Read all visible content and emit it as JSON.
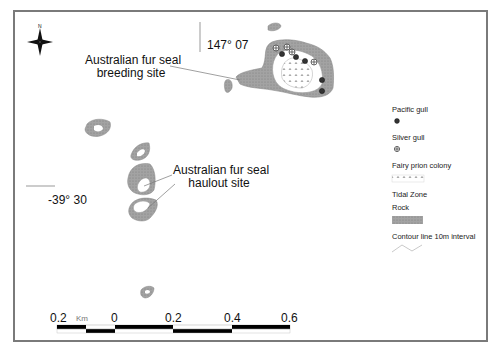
{
  "map": {
    "north_arrow": {
      "label": "N"
    },
    "coordinates": {
      "longitude": "147° 07",
      "latitude": "-39° 30"
    },
    "annotations": [
      {
        "id": "breeding",
        "lines": [
          "Australian fur seal",
          "breeding site"
        ]
      },
      {
        "id": "haulout",
        "lines": [
          "Australian fur seal",
          "haulout site"
        ]
      }
    ],
    "legend": {
      "items": [
        {
          "label": "Pacific gull",
          "symbol": "filled-circle-cross"
        },
        {
          "label": "Silver gull",
          "symbol": "circle-cross"
        },
        {
          "label": "Fairy prion colony",
          "symbol": "dotted-pattern"
        },
        {
          "label": "Tidal Zone",
          "symbol": "none"
        },
        {
          "label": "Rock",
          "symbol": "hatched-grey-fill"
        },
        {
          "label": "Contour line 10m interval",
          "symbol": "zigzag-line"
        }
      ]
    },
    "scale_bar": {
      "unit": "Km",
      "ticks": [
        "0.2",
        "0",
        "0.2",
        "0.4",
        "0.6"
      ]
    },
    "colors": {
      "frame": "#7a7a7a",
      "rock": "#9a9a9a",
      "line": "#888888",
      "scale_black": "#000000"
    }
  }
}
